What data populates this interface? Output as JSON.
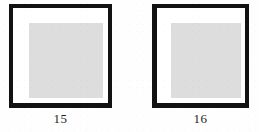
{
  "figure": {
    "background_color": "#ffffff",
    "panels": [
      {
        "id": "panel-15",
        "caption": "15",
        "frame_color": "#121212",
        "plate_color": "#dddddd",
        "plate_shape": "square"
      },
      {
        "id": "panel-16",
        "caption": "16",
        "frame_color": "#121212",
        "plate_color": "#dddddd",
        "plate_shape": "square"
      }
    ]
  }
}
